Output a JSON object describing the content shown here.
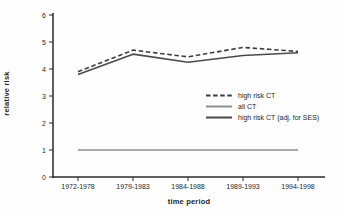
{
  "chart_data": {
    "type": "line",
    "title": "",
    "xlabel": "time period",
    "ylabel": "relative risk",
    "categories": [
      "1972-1978",
      "1979-1983",
      "1984-1988",
      "1989-1993",
      "1994-1998"
    ],
    "series": [
      {
        "name": "high risk CT",
        "style": "dashed",
        "color": "#3d3d3d",
        "values": [
          3.9,
          4.7,
          4.45,
          4.8,
          4.65
        ]
      },
      {
        "name": "all CT",
        "style": "solid",
        "color": "#8f8f8f",
        "values": [
          1.0,
          1.0,
          1.0,
          1.0,
          1.0
        ]
      },
      {
        "name": "high risk CT (adj. for SES)",
        "style": "solid",
        "color": "#4a4a4a",
        "values": [
          3.8,
          4.55,
          4.25,
          4.5,
          4.6
        ]
      }
    ],
    "ylim": [
      0,
      6
    ],
    "yticks": [
      0,
      1,
      2,
      3,
      4,
      5,
      6
    ],
    "grid": false,
    "legend_position": "middle-right",
    "axis_color": "#2b2b2b",
    "tick_label_color": "#1f1f1f"
  }
}
